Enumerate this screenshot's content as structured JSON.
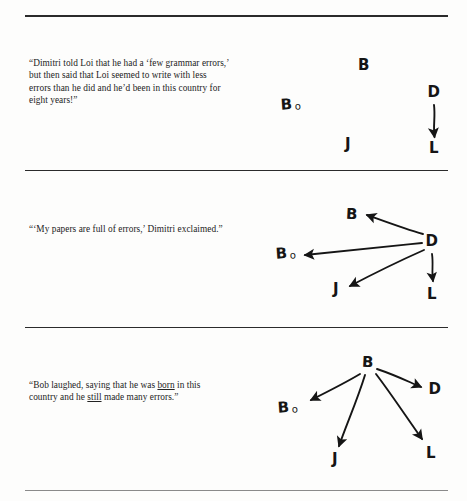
{
  "page": {
    "background_color": "#fdfdfc",
    "ink_color": "#151515",
    "rule_color": "#2b2b2b"
  },
  "rules": [
    {
      "name": "top-rule",
      "y": 15,
      "weight": 2.0,
      "color": "#2b2b2b"
    },
    {
      "name": "divider-rule-1",
      "y": 170,
      "weight": 1.4,
      "color": "#2b2b2b"
    },
    {
      "name": "divider-rule-2",
      "y": 327,
      "weight": 1.4,
      "color": "#2b2b2b"
    },
    {
      "name": "bottom-rule",
      "y": 490,
      "weight": 1.1,
      "color": "#8a8a8a"
    }
  ],
  "panels": [
    {
      "id": "panel-1",
      "quote_html": "“Dimitri told Loi that he had a ‘few grammar errors,’ but then said that Loi seemed to write with less errors than he did and he’d been in this country for eight years!”",
      "diagram": {
        "description": "Four scattered labels with a single arrow from D down to L",
        "nodes": [
          {
            "id": "B",
            "label": "B",
            "sub": "",
            "x": 109,
            "y": 48
          },
          {
            "id": "Bo",
            "label": "B",
            "sub": "o",
            "x": 36,
            "y": 87
          },
          {
            "id": "J",
            "label": "J",
            "sub": "",
            "x": 93,
            "y": 127
          },
          {
            "id": "D",
            "label": "D",
            "sub": "",
            "x": 179,
            "y": 75
          },
          {
            "id": "L",
            "label": "L",
            "sub": "",
            "x": 179,
            "y": 131
          }
        ],
        "arrows": [
          {
            "from": "D",
            "to": "L"
          }
        ]
      }
    },
    {
      "id": "panel-2",
      "quote_html": "“‘My papers are full of errors,’ Dimitri exclaimed.”",
      "diagram": {
        "description": "D is the hub; arrows radiate outward from D to B, Bo, J and L",
        "nodes": [
          {
            "id": "B",
            "label": "B",
            "sub": "",
            "x": 97,
            "y": 42
          },
          {
            "id": "Bo",
            "label": "B",
            "sub": "o",
            "x": 31,
            "y": 81
          },
          {
            "id": "J",
            "label": "J",
            "sub": "",
            "x": 81,
            "y": 117
          },
          {
            "id": "D",
            "label": "D",
            "sub": "",
            "x": 177,
            "y": 69
          },
          {
            "id": "L",
            "label": "L",
            "sub": "",
            "x": 177,
            "y": 122
          }
        ],
        "arrows": [
          {
            "from": "D",
            "to": "B"
          },
          {
            "from": "D",
            "to": "Bo"
          },
          {
            "from": "D",
            "to": "J"
          },
          {
            "from": "D",
            "to": "L"
          }
        ]
      }
    },
    {
      "id": "panel-3",
      "quote_html": "“Bob laughed, saying that he was <u>born</u> in this country and he <u>still</u> made many errors.”",
      "diagram": {
        "description": "B is the hub; arrows radiate outward from B to Bo, J, D and L",
        "nodes": [
          {
            "id": "B",
            "label": "B",
            "sub": "",
            "x": 113,
            "y": 33
          },
          {
            "id": "Bo",
            "label": "B",
            "sub": "o",
            "x": 33,
            "y": 78
          },
          {
            "id": "J",
            "label": "J",
            "sub": "",
            "x": 80,
            "y": 130
          },
          {
            "id": "D",
            "label": "D",
            "sub": "",
            "x": 180,
            "y": 60
          },
          {
            "id": "L",
            "label": "L",
            "sub": "",
            "x": 176,
            "y": 124
          }
        ],
        "arrows": [
          {
            "from": "B",
            "to": "Bo"
          },
          {
            "from": "B",
            "to": "J"
          },
          {
            "from": "B",
            "to": "D"
          },
          {
            "from": "B",
            "to": "L"
          }
        ]
      }
    }
  ]
}
